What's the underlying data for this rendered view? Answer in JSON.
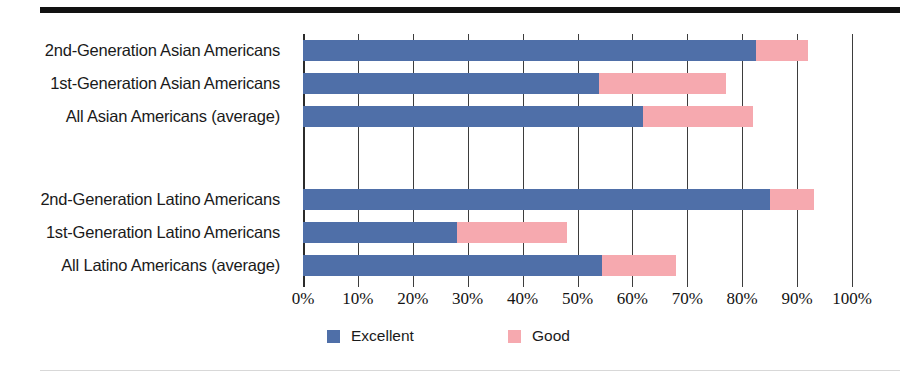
{
  "figure": {
    "top_rule": "top-rule",
    "bottom_rule": "bottom-rule"
  },
  "chart_data": {
    "type": "bar",
    "orientation": "horizontal",
    "stacked": true,
    "title": "",
    "subtitle": "",
    "xlabel": "",
    "ylabel": "",
    "xlim": [
      0,
      100
    ],
    "xtick_values": [
      0,
      10,
      20,
      30,
      40,
      50,
      60,
      70,
      80,
      90,
      100
    ],
    "xtick_labels": [
      "0%",
      "10%",
      "20%",
      "30%",
      "40%",
      "50%",
      "60%",
      "70%",
      "80%",
      "90%",
      "100%"
    ],
    "grid": true,
    "grid_axis": "x",
    "legend_position": "bottom",
    "categories": [
      "2nd-Generation Asian Americans",
      "1st-Generation Asian Americans",
      "All Asian Americans (average)",
      "",
      "2nd-Generation Latino Americans",
      "1st-Generation Latino Americans",
      "All Latino Americans (average)"
    ],
    "series": [
      {
        "name": "Excellent",
        "color": "#4f6fa8",
        "values": [
          82.5,
          54,
          62,
          null,
          85,
          28,
          54.5
        ]
      },
      {
        "name": "Good",
        "color": "#f6a9af",
        "values": [
          9.5,
          23,
          20,
          null,
          8,
          20,
          13.5
        ]
      }
    ],
    "rows": [
      {
        "label": "2nd-Generation Asian Americans",
        "excellent": 82.5,
        "good": 9.5,
        "total": 92.0
      },
      {
        "label": "1st-Generation Asian Americans",
        "excellent": 54.0,
        "good": 23.0,
        "total": 77.0
      },
      {
        "label": "All Asian Americans (average)",
        "excellent": 62.0,
        "good": 20.0,
        "total": 82.0
      },
      {
        "label": "",
        "excellent": null,
        "good": null,
        "total": null
      },
      {
        "label": "2nd-Generation Latino Americans",
        "excellent": 85.0,
        "good": 8.0,
        "total": 93.0
      },
      {
        "label": "1st-Generation Latino Americans",
        "excellent": 28.0,
        "good": 20.0,
        "total": 48.0
      },
      {
        "label": "All Latino Americans (average)",
        "excellent": 54.5,
        "good": 13.5,
        "total": 68.0
      }
    ],
    "legend": [
      {
        "label": "Excellent",
        "color": "#4f6fa8"
      },
      {
        "label": "Good",
        "color": "#f6a9af"
      }
    ]
  },
  "colors": {
    "excellent": "#4f6fa8",
    "good": "#f6a9af",
    "gridline": "#3d3d3d",
    "rule": "#111111",
    "text": "#1a1a1a"
  }
}
